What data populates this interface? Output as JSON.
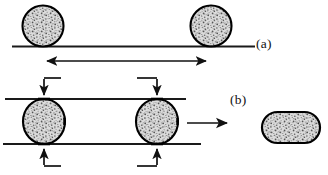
{
  "figure": {
    "background_color": "#ffffff",
    "outline_color": "#000000",
    "fill_texture_color": "#c9c9c9",
    "line_color": "#1a1a1a",
    "width": 328,
    "height": 175
  },
  "labels": {
    "panel_a": "(a)",
    "panel_b": "(b)"
  },
  "panel_a": {
    "name": "rolling-on-surface",
    "ground_line": {
      "x1": 12,
      "y1": 46.5,
      "x2": 255,
      "y2": 46.5
    },
    "particles": [
      {
        "name": "sphere-left",
        "cx": 43,
        "cy": 26,
        "r": 20.5
      },
      {
        "name": "sphere-right",
        "cx": 211,
        "cy": 26,
        "r": 20.5
      }
    ],
    "travel_arrow": {
      "name": "double-headed-travel-arrow",
      "x1": 45,
      "x2": 208,
      "y": 61,
      "heads": "both"
    }
  },
  "panel_b": {
    "name": "compression-between-rails",
    "rails": [
      {
        "name": "upper-rail",
        "x1": 5,
        "y1": 99,
        "x2": 186,
        "y2": 99
      },
      {
        "name": "lower-rail",
        "x1": 3,
        "y1": 144,
        "x2": 201,
        "y2": 144
      }
    ],
    "particles": [
      {
        "name": "compressed-sphere-left",
        "cx": 44,
        "cy": 121.5,
        "rx": 21,
        "ry": 22.5
      },
      {
        "name": "compressed-sphere-right",
        "cx": 157,
        "cy": 121.5,
        "rx": 21,
        "ry": 22.5
      }
    ],
    "force_arrows": [
      {
        "name": "top-force-arrow-left",
        "direction": "down",
        "x": 44,
        "from_y": 78,
        "to_y": 96,
        "elbow_x": 61,
        "elbow_side": "right"
      },
      {
        "name": "top-force-arrow-right",
        "direction": "down",
        "x": 157,
        "from_y": 78,
        "to_y": 96,
        "elbow_x": 137,
        "elbow_side": "left"
      },
      {
        "name": "bottom-force-arrow-left",
        "direction": "up",
        "x": 44,
        "from_y": 166,
        "to_y": 148,
        "elbow_x": 61,
        "elbow_side": "right"
      },
      {
        "name": "bottom-force-arrow-right",
        "direction": "up",
        "x": 157,
        "from_y": 166,
        "to_y": 148,
        "elbow_x": 137,
        "elbow_side": "left"
      }
    ],
    "result_arrow": {
      "name": "result-transition-arrow",
      "x1": 187,
      "x2": 229,
      "y": 123,
      "heads": "right"
    },
    "result_shape": {
      "name": "flattened-capsule",
      "x": 262,
      "y": 112,
      "width": 58,
      "height": 31,
      "corner_radius": 15.5
    }
  }
}
